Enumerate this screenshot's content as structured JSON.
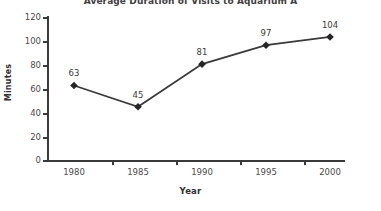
{
  "chart_data": {
    "type": "line",
    "title": "Average Duration of Visits to Aquarium A",
    "xlabel": "Year",
    "ylabel": "Minutes",
    "categories": [
      "1980",
      "1985",
      "1990",
      "1995",
      "2000"
    ],
    "values": [
      63,
      45,
      81,
      97,
      104
    ],
    "point_labels": [
      "63",
      "45",
      "81",
      "97",
      "104"
    ],
    "ylim": [
      0,
      120
    ],
    "ytick_labels": [
      "120",
      "100",
      "80",
      "60",
      "40",
      "20",
      "0"
    ],
    "ytick_values": [
      120,
      100,
      80,
      60,
      40,
      20,
      0
    ],
    "grid": false,
    "legend": "none",
    "series": [
      {
        "name": "Average Duration of Visits to Aquarium A",
        "values": [
          63,
          45,
          81,
          97,
          104
        ]
      }
    ],
    "colors": {
      "line": "#3a3a3a",
      "marker": "#262626",
      "axis": "#3a3a3a",
      "text": "#4a4a4a",
      "background": "#ffffff"
    }
  }
}
